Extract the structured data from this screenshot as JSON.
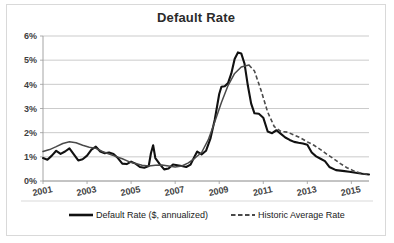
{
  "chart_data": {
    "type": "line",
    "title": "Default Rate",
    "xlabel": "",
    "ylabel": "",
    "xlim": [
      2001,
      2015.8
    ],
    "ylim": [
      0,
      6
    ],
    "grid": true,
    "legend_position": "bottom",
    "y_tick_labels": [
      "0%",
      "1%",
      "2%",
      "3%",
      "4%",
      "5%",
      "6%"
    ],
    "y_tick_values": [
      0,
      1,
      2,
      3,
      4,
      5,
      6
    ],
    "x_tick_labels": [
      "2001",
      "2003",
      "2005",
      "2007",
      "2009",
      "2011",
      "2013",
      "2015"
    ],
    "x_tick_values": [
      2001,
      2003,
      2005,
      2007,
      2009,
      2011,
      2013,
      2015
    ],
    "series": [
      {
        "name": "Default Rate ($, annualized)",
        "style": "solid",
        "color": "#111111",
        "x": [
          2001.0,
          2001.2,
          2001.4,
          2001.6,
          2001.8,
          2002.0,
          2002.2,
          2002.4,
          2002.6,
          2002.8,
          2003.0,
          2003.2,
          2003.4,
          2003.6,
          2003.8,
          2004.0,
          2004.2,
          2004.4,
          2004.6,
          2004.8,
          2005.0,
          2005.2,
          2005.4,
          2005.6,
          2005.8,
          2005.9,
          2006.0,
          2006.1,
          2006.3,
          2006.5,
          2006.7,
          2006.9,
          2007.1,
          2007.3,
          2007.5,
          2007.7,
          2007.9,
          2008.0,
          2008.2,
          2008.4,
          2008.6,
          2008.8,
          2009.0,
          2009.1,
          2009.25,
          2009.4,
          2009.55,
          2009.7,
          2009.85,
          2010.0,
          2010.15,
          2010.3,
          2010.45,
          2010.6,
          2010.8,
          2011.0,
          2011.2,
          2011.4,
          2011.6,
          2011.8,
          2012.0,
          2012.2,
          2012.4,
          2012.6,
          2012.8,
          2013.0,
          2013.2,
          2013.4,
          2013.6,
          2013.8,
          2014.0,
          2014.3,
          2014.6,
          2014.9,
          2015.2,
          2015.5,
          2015.8
        ],
        "values": [
          0.95,
          0.88,
          1.05,
          1.25,
          1.12,
          1.22,
          1.35,
          1.1,
          0.85,
          0.9,
          1.05,
          1.3,
          1.42,
          1.22,
          1.15,
          1.18,
          1.12,
          0.95,
          0.72,
          0.7,
          0.8,
          0.72,
          0.58,
          0.55,
          0.62,
          1.15,
          1.48,
          0.95,
          0.7,
          0.48,
          0.52,
          0.68,
          0.65,
          0.62,
          0.58,
          0.68,
          1.05,
          1.22,
          1.1,
          1.25,
          1.75,
          2.55,
          3.6,
          3.9,
          3.92,
          4.05,
          4.45,
          5.05,
          5.32,
          5.28,
          4.85,
          3.95,
          3.2,
          2.8,
          2.78,
          2.62,
          2.05,
          1.98,
          2.1,
          1.95,
          1.8,
          1.7,
          1.62,
          1.58,
          1.55,
          1.5,
          1.18,
          1.02,
          0.92,
          0.82,
          0.58,
          0.45,
          0.42,
          0.38,
          0.34,
          0.3,
          0.27
        ]
      },
      {
        "name": "Historic Average Rate",
        "style": "dashed-tail",
        "color": "#4a4a4a",
        "dash_start_x": 2010.35,
        "x": [
          2001.0,
          2001.3,
          2001.6,
          2001.9,
          2002.2,
          2002.5,
          2002.8,
          2003.1,
          2003.4,
          2003.7,
          2004.0,
          2004.3,
          2004.6,
          2004.9,
          2005.2,
          2005.5,
          2005.8,
          2006.1,
          2006.4,
          2006.7,
          2007.0,
          2007.3,
          2007.6,
          2007.9,
          2008.2,
          2008.5,
          2008.8,
          2009.1,
          2009.4,
          2009.7,
          2010.0,
          2010.35,
          2010.6,
          2010.9,
          2011.2,
          2011.5,
          2011.8,
          2012.1,
          2012.4,
          2012.7,
          2013.0,
          2013.3,
          2013.6,
          2013.9,
          2014.2,
          2014.5,
          2014.8,
          2015.1,
          2015.4,
          2015.8
        ],
        "values": [
          1.22,
          1.3,
          1.42,
          1.55,
          1.62,
          1.58,
          1.48,
          1.4,
          1.35,
          1.22,
          1.12,
          1.02,
          0.92,
          0.8,
          0.72,
          0.65,
          0.62,
          0.65,
          0.66,
          0.62,
          0.58,
          0.62,
          0.75,
          0.95,
          1.18,
          1.7,
          2.45,
          3.25,
          3.95,
          4.45,
          4.72,
          4.8,
          4.55,
          3.75,
          2.85,
          2.25,
          2.05,
          2.02,
          1.9,
          1.78,
          1.62,
          1.48,
          1.3,
          1.1,
          0.92,
          0.72,
          0.55,
          0.42,
          0.33,
          0.27
        ]
      }
    ]
  },
  "legend": {
    "items": [
      {
        "label": "Default Rate ($, annualized)",
        "style": "solid"
      },
      {
        "label": "Historic Average Rate",
        "style": "dashed"
      }
    ]
  }
}
